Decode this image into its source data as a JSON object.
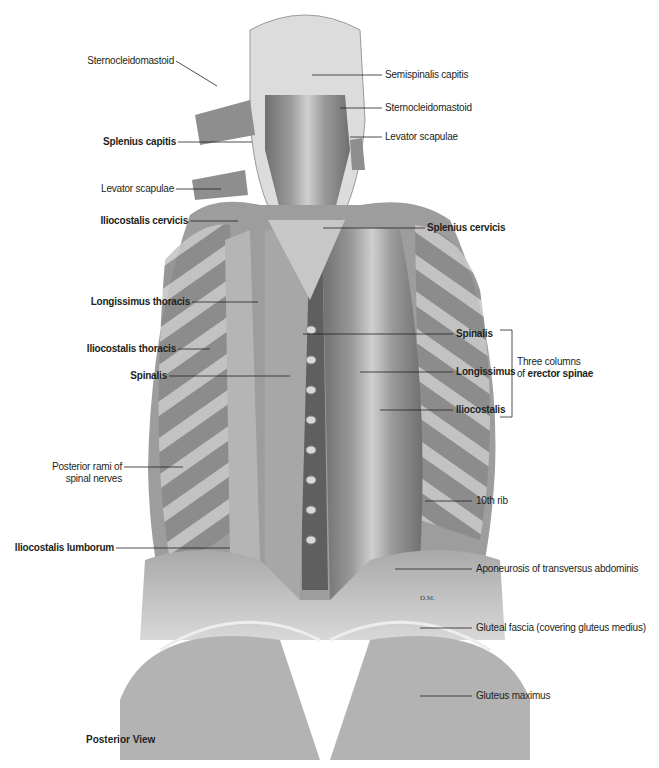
{
  "figure": {
    "view_caption": "Posterior View",
    "signature": "D.M.",
    "bracket_group": {
      "line1": "Three columns",
      "line2_prefix": "of ",
      "line2_bold": "erector spinae"
    },
    "labels_left": [
      {
        "id": "sternocleidomastoid-left",
        "text": "Sternocleidomastoid",
        "bold": false
      },
      {
        "id": "splenius-capitis",
        "text": "Splenius capitis",
        "bold": true
      },
      {
        "id": "levator-scapulae-left",
        "text": "Levator scapulae",
        "bold": false
      },
      {
        "id": "iliocostalis-cervicis",
        "text": "Iliocostalis cervicis",
        "bold": true
      },
      {
        "id": "longissimus-thoracis",
        "text": "Longissimus thoracis",
        "bold": true
      },
      {
        "id": "iliocostalis-thoracis",
        "text": "Iliocostalis thoracis",
        "bold": true
      },
      {
        "id": "spinalis-left",
        "text": "Spinalis",
        "bold": true
      },
      {
        "id": "posterior-rami",
        "text": "Posterior rami of",
        "text2": "spinal nerves",
        "bold": false
      },
      {
        "id": "iliocostalis-lumborum",
        "text": "Iliocostalis lumborum",
        "bold": true
      }
    ],
    "labels_right": [
      {
        "id": "semispinalis-capitis",
        "text": "Semispinalis capitis",
        "bold": false
      },
      {
        "id": "sternocleidomastoid-right",
        "text": "Sternocleidomastoid",
        "bold": false
      },
      {
        "id": "levator-scapulae-right",
        "text": "Levator scapulae",
        "bold": false
      },
      {
        "id": "splenius-cervicis",
        "text": "Splenius cervicis",
        "bold": true
      },
      {
        "id": "spinalis-right",
        "text": "Spinalis",
        "bold": true
      },
      {
        "id": "longissimus",
        "text": "Longissimus",
        "bold": true
      },
      {
        "id": "iliocostalis",
        "text": "Iliocostalis",
        "bold": true
      },
      {
        "id": "tenth-rib",
        "text": "10th rib",
        "bold": false
      },
      {
        "id": "aponeurosis",
        "text": "Aponeurosis of transversus abdominis",
        "bold": false
      },
      {
        "id": "gluteal-fascia",
        "text": "Gluteal fascia (covering gluteus medius)",
        "bold": false
      },
      {
        "id": "gluteus-maximus",
        "text": "Gluteus maximus",
        "bold": false
      }
    ]
  }
}
